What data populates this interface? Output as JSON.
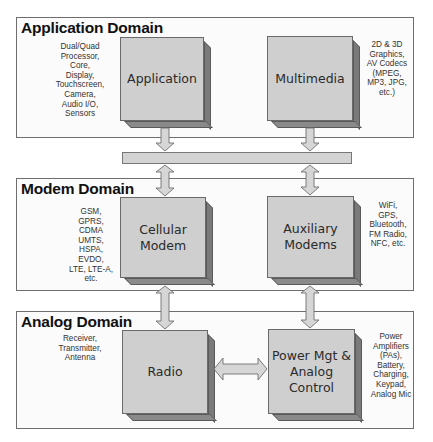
{
  "domains": [
    {
      "id": "application",
      "title": "Application Domain",
      "blocks": [
        {
          "label": "Application",
          "note": "Dual/Quad\nProcessor,\nCore,\nDisplay,\nTouchscreen,\nCamera,\nAudio I/O,\nSensors"
        },
        {
          "label": "Multimedia",
          "note": "2D & 3D\nGraphics,\nAV Codecs\n(MPEG,\nMP3, JPG,\netc.)"
        }
      ]
    },
    {
      "id": "modem",
      "title": "Modem Domain",
      "blocks": [
        {
          "label": "Cellular\nModem",
          "note": "GSM,\nGPRS,\nCDMA\nUMTS,\nHSPA,\nEVDO,\nLTE, LTE-A,\netc."
        },
        {
          "label": "Auxiliary\nModems",
          "note": "WiFi,\nGPS,\nBluetooth,\nFM Radio,\nNFC, etc."
        }
      ]
    },
    {
      "id": "analog",
      "title": "Analog Domain",
      "blocks": [
        {
          "label": "Radio",
          "note": "Receiver,\nTransmitter,\nAntenna"
        },
        {
          "label": "Power Mgt &\nAnalog\nControl",
          "note": "Power\nAmplifiers\n(PAs),\nBattery,\nCharging,\nKeypad,\nAnalog Mic"
        }
      ]
    }
  ],
  "bus": {
    "label": ""
  },
  "colors": {
    "block_face": "#cfcfcf",
    "block_side": "#7a7a7a",
    "arrow_fill": "#d6d6d6",
    "border": "#6e6e6e"
  }
}
